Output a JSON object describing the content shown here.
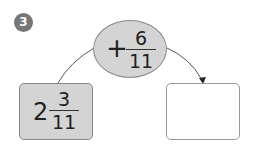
{
  "problem_number": "3",
  "operation": {
    "operator": "+",
    "numerator": "6",
    "denominator": "11"
  },
  "start": {
    "whole": "2",
    "numerator": "3",
    "denominator": "11"
  },
  "answer": {
    "value": ""
  },
  "colors": {
    "fill": "#d4d4d4",
    "badge": "#777777"
  }
}
